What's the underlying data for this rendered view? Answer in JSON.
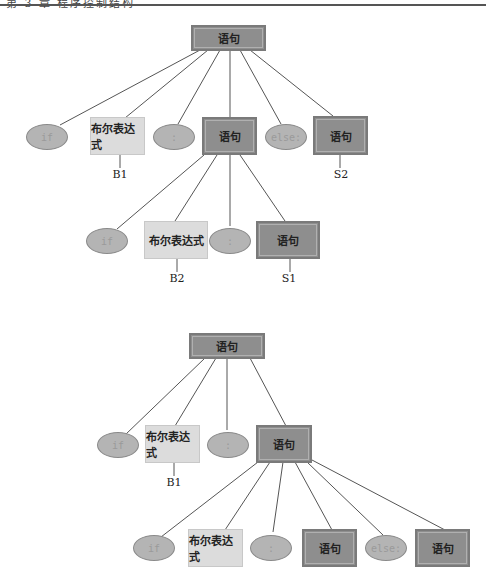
{
  "header": {
    "text": "第 3 章   程序控制结构"
  },
  "colors": {
    "dark_box": "#8e8e8e",
    "light_box": "#dcdcdc",
    "ellipse": "#b4b4b4",
    "edge": "#555555"
  },
  "tree1": {
    "root": {
      "text": "语句"
    },
    "level1": [
      {
        "kind": "ellipse",
        "text": "if"
      },
      {
        "kind": "light",
        "text": "布尔表达式",
        "annotation": "B1"
      },
      {
        "kind": "ellipse",
        "text": ":"
      },
      {
        "kind": "dark",
        "text": "语句"
      },
      {
        "kind": "ellipse",
        "text": "else:"
      },
      {
        "kind": "dark",
        "text": "语句",
        "annotation": "S2"
      }
    ],
    "level2": [
      {
        "kind": "ellipse",
        "text": "if"
      },
      {
        "kind": "light",
        "text": "布尔表达式",
        "annotation": "B2"
      },
      {
        "kind": "ellipse",
        "text": ":"
      },
      {
        "kind": "dark",
        "text": "语句",
        "annotation": "S1"
      }
    ]
  },
  "tree2": {
    "root": {
      "text": "语句"
    },
    "level1": [
      {
        "kind": "ellipse",
        "text": "if"
      },
      {
        "kind": "light",
        "text": "布尔表达式",
        "annotation": "B1"
      },
      {
        "kind": "ellipse",
        "text": ":"
      },
      {
        "kind": "dark",
        "text": "语句"
      }
    ],
    "level2": [
      {
        "kind": "ellipse",
        "text": "if"
      },
      {
        "kind": "light",
        "text": "布尔表达式"
      },
      {
        "kind": "ellipse",
        "text": ":"
      },
      {
        "kind": "dark",
        "text": "语句"
      },
      {
        "kind": "ellipse",
        "text": "else:"
      },
      {
        "kind": "dark",
        "text": "语句"
      }
    ]
  }
}
